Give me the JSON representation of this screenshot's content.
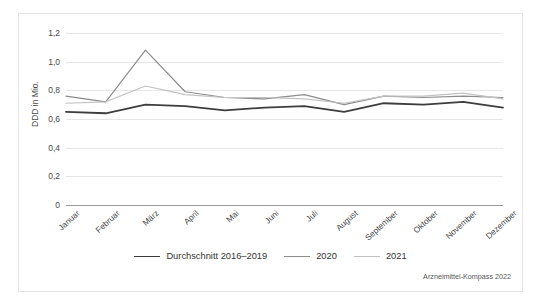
{
  "figure": {
    "source_note": "Arzneimittel-Kompass 2022"
  },
  "chart_data": {
    "type": "line",
    "title": "",
    "xlabel": "",
    "ylabel": "DDD in Mio.",
    "categories": [
      "Januar",
      "Februar",
      "März",
      "April",
      "Mai",
      "Juni",
      "Juli",
      "August",
      "September",
      "Oktober",
      "November",
      "Dezember"
    ],
    "ylim": [
      0,
      1.2
    ],
    "yticks": [
      0,
      0.2,
      0.4,
      0.6,
      0.8,
      1.0,
      1.2
    ],
    "ytick_labels": [
      "0",
      "0,2",
      "0,4",
      "0,6",
      "0,8",
      "1,0",
      "1,2"
    ],
    "grid": true,
    "legend_position": "bottom",
    "series": [
      {
        "name": "Durchschnitt 2016–2019",
        "color": "#3d3d3d",
        "width": 1.8,
        "values": [
          0.65,
          0.64,
          0.7,
          0.69,
          0.66,
          0.68,
          0.69,
          0.65,
          0.71,
          0.7,
          0.72,
          0.68
        ]
      },
      {
        "name": "2020",
        "color": "#8c8c8c",
        "width": 1.2,
        "values": [
          0.76,
          0.72,
          1.08,
          0.79,
          0.75,
          0.74,
          0.77,
          0.7,
          0.76,
          0.75,
          0.76,
          0.75
        ]
      },
      {
        "name": "2021",
        "color": "#c2c2c2",
        "width": 1.2,
        "values": [
          0.71,
          0.72,
          0.83,
          0.77,
          0.75,
          0.75,
          0.74,
          0.71,
          0.76,
          0.76,
          0.78,
          0.74
        ]
      }
    ]
  }
}
